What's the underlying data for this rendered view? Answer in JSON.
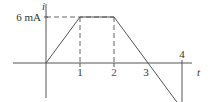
{
  "chart_data": {
    "type": "line",
    "title": "",
    "xlabel": "t",
    "ylabel": "i",
    "x": [
      0,
      1,
      2,
      4,
      4
    ],
    "values": [
      0,
      6,
      6,
      -6,
      0
    ],
    "units": "mA",
    "xlim": [
      -1,
      4.6
    ],
    "ylim": [
      -6,
      6
    ],
    "x_ticks": [
      {
        "value": 1,
        "label": "1",
        "color": "#333333",
        "tick": true
      },
      {
        "value": 2,
        "label": "2",
        "color": "#6a3d8f",
        "tick": true
      },
      {
        "value": 3,
        "label": "3",
        "color": "#333333",
        "tick": false
      },
      {
        "value": 4,
        "label": "4",
        "color": "#333333",
        "tick": true,
        "position": "above"
      }
    ],
    "y_labels": [
      {
        "value": 6,
        "label": "6 mA"
      },
      {
        "value": -6,
        "label": "6 mA"
      }
    ],
    "guides": {
      "dashed_horizontal": [
        6,
        -6
      ],
      "dashed_vertical_at_t": [
        1,
        2
      ]
    },
    "grid": false,
    "legend": "none"
  }
}
